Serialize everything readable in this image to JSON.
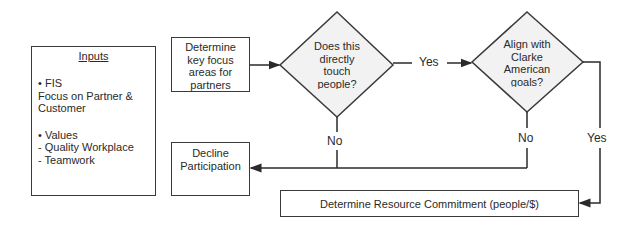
{
  "inputs_box": {
    "title": "Inputs",
    "bullet1": "• FIS",
    "line1": "Focus on Partner &",
    "line2": "Customer",
    "bullet2": "• Values",
    "line3": "- Quality Workplace",
    "line4": "- Teamwork"
  },
  "nodes": {
    "focus": {
      "line1": "Determine",
      "line2": "key focus",
      "line3": "areas for",
      "line4": "partners"
    },
    "decision1": {
      "line1": "Does this",
      "line2": "directly",
      "line3": "touch",
      "line4": "people?"
    },
    "decision2": {
      "line1": "Align with",
      "line2": "Clarke",
      "line3": "American",
      "line4": "goals?"
    },
    "decline": {
      "line1": "Decline",
      "line2": "Participation"
    },
    "resource": {
      "text": "Determine Resource Commitment (people/$)"
    }
  },
  "edge_labels": {
    "d1_yes": "Yes",
    "d1_no": "No",
    "d2_no": "No",
    "d2_yes": "Yes"
  },
  "colors": {
    "stroke": "#3a3a3a",
    "diamond_fill": "#f2f2f2",
    "text": "#2a2a2a"
  }
}
